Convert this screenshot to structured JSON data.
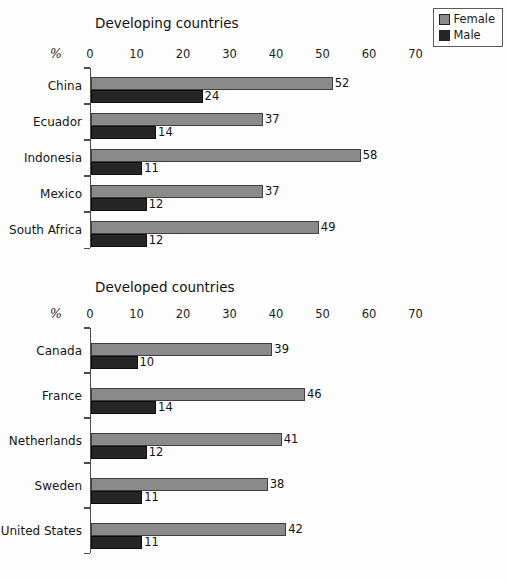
{
  "page": {
    "background": "#fdfdfd"
  },
  "legend": {
    "position": "top-right",
    "items": [
      {
        "label": "Female",
        "color": "#8a8a8a"
      },
      {
        "label": "Male",
        "color": "#262626"
      }
    ]
  },
  "chart_data": [
    {
      "type": "bar",
      "orientation": "horizontal",
      "title": "Developing countries",
      "xlabel": "%",
      "xlim": [
        0,
        70
      ],
      "xticks": [
        0,
        10,
        20,
        30,
        40,
        50,
        60,
        70
      ],
      "grid": false,
      "legend_position": "top-right",
      "categories": [
        "China",
        "Ecuador",
        "Indonesia",
        "Mexico",
        "South Africa"
      ],
      "series": [
        {
          "name": "Female",
          "color": "#8a8a8a",
          "values": [
            52,
            37,
            58,
            37,
            49
          ]
        },
        {
          "name": "Male",
          "color": "#262626",
          "values": [
            24,
            14,
            11,
            12,
            12
          ]
        }
      ]
    },
    {
      "type": "bar",
      "orientation": "horizontal",
      "title": "Developed countries",
      "xlabel": "%",
      "xlim": [
        0,
        70
      ],
      "xticks": [
        0,
        10,
        20,
        30,
        40,
        50,
        60,
        70
      ],
      "grid": false,
      "legend_position": "none",
      "categories": [
        "Canada",
        "France",
        "Netherlands",
        "Sweden",
        "United States"
      ],
      "series": [
        {
          "name": "Female",
          "color": "#8a8a8a",
          "values": [
            39,
            46,
            41,
            38,
            42
          ]
        },
        {
          "name": "Male",
          "color": "#262626",
          "values": [
            10,
            14,
            12,
            11,
            11
          ]
        }
      ]
    }
  ]
}
